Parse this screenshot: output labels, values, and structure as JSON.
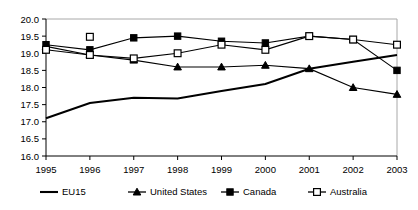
{
  "chart_data": {
    "type": "line",
    "title": "",
    "xlabel": "",
    "ylabel": "",
    "categories": [
      "1995",
      "1996",
      "1997",
      "1998",
      "1999",
      "2000",
      "2001",
      "2002",
      "2003"
    ],
    "x": [
      1995,
      1996,
      1997,
      1998,
      1999,
      2000,
      2001,
      2002,
      2003
    ],
    "ylim": [
      16.0,
      20.0
    ],
    "xlim": [
      1995,
      2003
    ],
    "ytick_labels": [
      "20.0",
      "19.5",
      "19.0",
      "18.5",
      "18.0",
      "17.5",
      "17.0",
      "16.5",
      "16.0"
    ],
    "ytick_values": [
      20.0,
      19.5,
      19.0,
      18.5,
      18.0,
      17.5,
      17.0,
      16.5,
      16.0
    ],
    "grid": false,
    "legend_position": "bottom",
    "series": [
      {
        "name": "EU15",
        "marker": "none",
        "values": [
          17.1,
          17.55,
          17.7,
          17.68,
          17.9,
          18.1,
          18.55,
          18.75,
          18.95
        ]
      },
      {
        "name": "United States",
        "marker": "triangle-filled",
        "values": [
          19.2,
          18.95,
          18.8,
          18.6,
          18.6,
          18.65,
          18.55,
          18.0,
          17.8
        ]
      },
      {
        "name": "Canada",
        "marker": "square-filled",
        "values": [
          19.25,
          19.1,
          19.45,
          19.5,
          19.35,
          19.3,
          19.5,
          19.4,
          18.5
        ]
      },
      {
        "name": "Australia",
        "marker": "square-open",
        "values": [
          19.1,
          18.95,
          18.85,
          19.0,
          19.25,
          19.1,
          19.5,
          19.4,
          19.25
        ]
      }
    ],
    "annotations": [
      {
        "series": "Australia",
        "x": 1996,
        "y": 19.48,
        "note": "isolated open-square marker above the line"
      }
    ]
  },
  "legend": {
    "items": [
      {
        "label": "EU15",
        "marker": "none"
      },
      {
        "label": "United States",
        "marker": "triangle-filled"
      },
      {
        "label": "Canada",
        "marker": "square-filled"
      },
      {
        "label": "Australia",
        "marker": "square-open"
      }
    ]
  },
  "colors": {
    "ink": "#000000",
    "frame": "#a8a8a8",
    "background": "#ffffff"
  }
}
